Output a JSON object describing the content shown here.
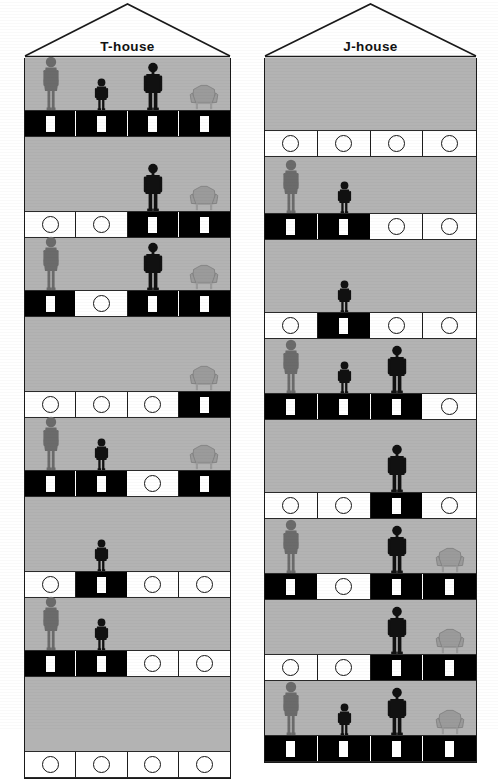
{
  "figure": {
    "caption_present": false,
    "legend_glyphs": {
      "woman": "adult-woman-silhouette",
      "child": "child-silhouette",
      "man": "adult-man-silhouette",
      "chair": "armchair-silhouette"
    },
    "cell_states": {
      "filled": "filled-black-door",
      "empty": "empty-white-circle"
    }
  },
  "colors": {
    "wall": "#b3b3b3",
    "outline": "#1a1a1a",
    "filled_cell": "#000000",
    "empty_cell": "#ffffff",
    "gray_figure": "#6b6b6b",
    "dark_figure": "#111111",
    "chair": "#9b9b9b"
  },
  "houses": [
    {
      "id": "t-house",
      "label": "T-house",
      "roof_icon": "gable-roof",
      "columns": 4,
      "floors": [
        {
          "index": 1,
          "figures": [
            "woman",
            "child",
            "man",
            "chair"
          ],
          "cells": [
            "filled",
            "filled",
            "filled",
            "filled"
          ]
        },
        {
          "index": 2,
          "figures": [
            "none",
            "none",
            "man",
            "chair"
          ],
          "cells": [
            "empty",
            "empty",
            "filled",
            "filled"
          ]
        },
        {
          "index": 3,
          "figures": [
            "woman",
            "none",
            "man",
            "chair"
          ],
          "cells": [
            "filled",
            "empty",
            "filled",
            "filled"
          ]
        },
        {
          "index": 4,
          "figures": [
            "none",
            "none",
            "none",
            "chair"
          ],
          "cells": [
            "empty",
            "empty",
            "empty",
            "filled"
          ]
        },
        {
          "index": 5,
          "figures": [
            "woman",
            "child",
            "none",
            "chair"
          ],
          "cells": [
            "filled",
            "filled",
            "empty",
            "filled"
          ]
        },
        {
          "index": 6,
          "figures": [
            "none",
            "child",
            "none",
            "none"
          ],
          "cells": [
            "empty",
            "filled",
            "empty",
            "empty"
          ]
        },
        {
          "index": 7,
          "figures": [
            "woman",
            "child",
            "none",
            "none"
          ],
          "cells": [
            "filled",
            "filled",
            "empty",
            "empty"
          ]
        },
        {
          "index": 8,
          "figures": [
            "none",
            "none",
            "none",
            "none"
          ],
          "cells": [
            "empty",
            "empty",
            "empty",
            "empty"
          ]
        }
      ]
    },
    {
      "id": "j-house",
      "label": "J-house",
      "roof_icon": "gable-roof",
      "columns": 4,
      "floors": [
        {
          "index": 1,
          "figures": [
            "none",
            "none",
            "none",
            "none"
          ],
          "cells": [
            "empty",
            "empty",
            "empty",
            "empty"
          ]
        },
        {
          "index": 2,
          "figures": [
            "woman",
            "child",
            "none",
            "none"
          ],
          "cells": [
            "filled",
            "filled",
            "empty",
            "empty"
          ]
        },
        {
          "index": 3,
          "figures": [
            "none",
            "child",
            "none",
            "none"
          ],
          "cells": [
            "empty",
            "filled",
            "empty",
            "empty"
          ]
        },
        {
          "index": 4,
          "figures": [
            "woman",
            "child",
            "man",
            "none"
          ],
          "cells": [
            "filled",
            "filled",
            "filled",
            "empty"
          ]
        },
        {
          "index": 5,
          "figures": [
            "none",
            "none",
            "man",
            "none"
          ],
          "cells": [
            "empty",
            "empty",
            "filled",
            "empty"
          ]
        },
        {
          "index": 6,
          "figures": [
            "woman",
            "none",
            "man",
            "chair"
          ],
          "cells": [
            "filled",
            "empty",
            "filled",
            "filled"
          ]
        },
        {
          "index": 7,
          "figures": [
            "none",
            "none",
            "man",
            "chair"
          ],
          "cells": [
            "empty",
            "empty",
            "filled",
            "filled"
          ]
        },
        {
          "index": 8,
          "figures": [
            "woman",
            "child",
            "man",
            "chair"
          ],
          "cells": [
            "filled",
            "filled",
            "filled",
            "filled"
          ]
        }
      ]
    }
  ]
}
